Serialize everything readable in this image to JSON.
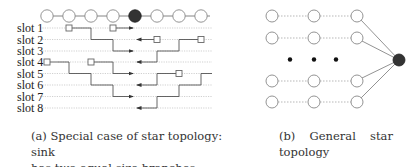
{
  "figure_a": {
    "slot_labels": [
      "slot 1",
      "slot 2",
      "slot 3",
      "slot 4",
      "slot 5",
      "slot 6",
      "slot 7",
      "slot 8"
    ],
    "node_count": 8,
    "sink_index": 4,
    "caption_line1": "(a) Special case of star topology: sink",
    "caption_line2": "has two equal size branches"
  },
  "figure_b": {
    "rows_shown": 4,
    "columns": 3,
    "ellipsis": "• • •",
    "caption_tag": "(b)",
    "caption_word1": "General",
    "caption_word2": "star",
    "caption_line2": "topology"
  },
  "colors": {
    "node_stroke": "#8a8a8a",
    "sink_fill": "#333333",
    "line": "#555555",
    "dotted": "#bbbbbb"
  }
}
